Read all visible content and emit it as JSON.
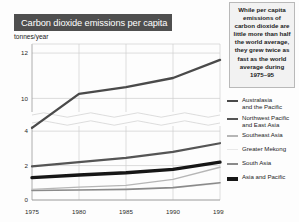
{
  "title": "Carbon dioxide emissions per capita",
  "callout": {
    "text": "While per capita emissions of carbon dioxide are little more than half the world average, they grew twice as fast as the world average during 1975–95"
  },
  "legend": [
    {
      "label": "Australasia\nand the Pacific",
      "color": "#4a4a4a",
      "thickness": 2.4
    },
    {
      "label": "Northwest Pacific\nand  East Asia",
      "color": "#555555",
      "thickness": 2.2
    },
    {
      "label": "Southeast Asia",
      "color": "#b6b6b6",
      "thickness": 1.4
    },
    {
      "label": "Greater Mekong",
      "color": "#e8e8e8",
      "thickness": 0.9
    },
    {
      "label": "South Asia",
      "color": "#8a8a8a",
      "thickness": 1.6
    },
    {
      "label": "Asia and Pacific",
      "color": "#161616",
      "thickness": 3.4
    }
  ],
  "chart_data": {
    "type": "line",
    "title": "Carbon dioxide emissions per capita",
    "xlabel": "",
    "ylabel": "tonnes/year",
    "unit_label": "tonnes/year",
    "x": [
      1975,
      1980,
      1985,
      1990,
      1995
    ],
    "xtick_labels": [
      "1975",
      "1980",
      "1985",
      "1990",
      "1995"
    ],
    "xlim": [
      1975,
      1995
    ],
    "grid": true,
    "legend_position": "right",
    "broken_axis": true,
    "axis_break_between": [
      4.3,
      9.4
    ],
    "upper_panel": {
      "ylim": [
        9.4,
        12.4
      ],
      "ytick_labels": [
        "12",
        "10"
      ],
      "yticks": [
        12,
        10
      ]
    },
    "lower_panel": {
      "ylim": [
        0,
        4.3
      ],
      "ytick_labels": [
        "4",
        "2",
        "0"
      ],
      "yticks": [
        4,
        2,
        0
      ]
    },
    "series": [
      {
        "name": "Australasia and the Pacific",
        "color": "#4a4a4a",
        "thickness": 2.4,
        "panel": "upper",
        "values": [
          8.7,
          10.2,
          10.5,
          10.9,
          11.7
        ]
      },
      {
        "name": "Northwest Pacific and East Asia",
        "color": "#555555",
        "thickness": 2.2,
        "panel": "lower",
        "values": [
          1.95,
          2.2,
          2.45,
          2.8,
          3.3
        ]
      },
      {
        "name": "Asia and Pacific",
        "color": "#161616",
        "thickness": 3.4,
        "panel": "lower",
        "values": [
          1.3,
          1.45,
          1.58,
          1.78,
          2.2
        ]
      },
      {
        "name": "Southeast Asia",
        "color": "#b6b6b6",
        "thickness": 1.4,
        "panel": "lower",
        "values": [
          0.62,
          0.75,
          0.85,
          1.2,
          1.9
        ]
      },
      {
        "name": "Greater Mekong",
        "color": "#e8e8e8",
        "thickness": 0.9,
        "panel": "lower",
        "values": [
          0.58,
          0.6,
          0.62,
          0.7,
          0.95
        ]
      },
      {
        "name": "South Asia",
        "color": "#8a8a8a",
        "thickness": 1.6,
        "panel": "lower",
        "values": [
          0.55,
          0.58,
          0.62,
          0.72,
          1.0
        ]
      }
    ]
  }
}
